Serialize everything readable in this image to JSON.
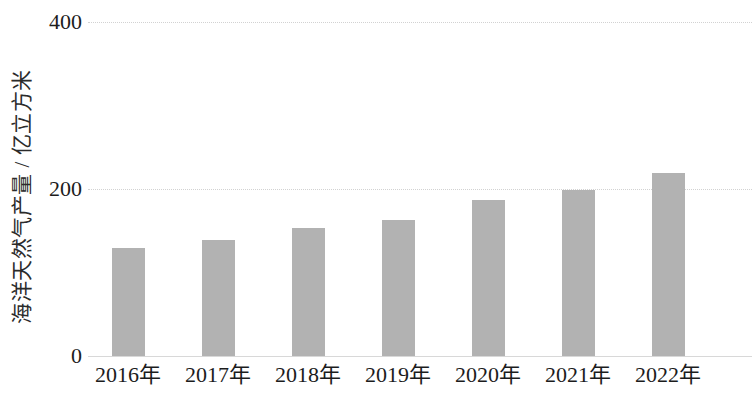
{
  "chart_data": {
    "type": "bar",
    "title": "",
    "subtitle": "",
    "xlabel": "",
    "ylabel": "海洋天然气产量 / 亿立方米",
    "categories": [
      "2016年",
      "2017年",
      "2018年",
      "2019年",
      "2020年",
      "2021年",
      "2022年"
    ],
    "values": [
      129,
      139,
      153,
      163,
      187,
      199,
      219
    ],
    "series": [
      {
        "name": "海洋天然气产量",
        "values": [
          129,
          139,
          153,
          163,
          187,
          199,
          219
        ]
      }
    ],
    "ylim": [
      0,
      400
    ],
    "xlim_index": [
      0,
      6
    ],
    "y_ticks": [
      0,
      200,
      400
    ],
    "y_tick_labels": [
      "0",
      "200",
      "400"
    ],
    "grid": true,
    "grid_axis": "y",
    "legend": false,
    "legend_position": "none",
    "bar_color": "#b2b2b2",
    "gridline_color": "#d2d2d2",
    "text_color": "#1c1c1c",
    "background_color": "#ffffff",
    "annotations": [],
    "data_labels": false,
    "units": "亿立方米"
  },
  "axes": {
    "y_title": "海洋天然气产量 / 亿立方米",
    "ticks": [
      {
        "label": "400",
        "value": 400
      },
      {
        "label": "200",
        "value": 200
      },
      {
        "label": "0",
        "value": 0
      }
    ]
  }
}
